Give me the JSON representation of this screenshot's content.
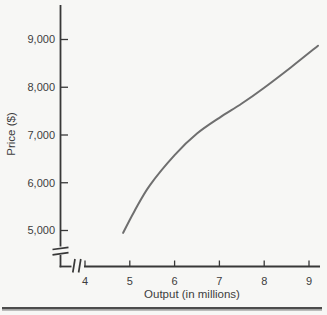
{
  "figure": {
    "background": "#f7f7f5",
    "has_bottom_rule": true
  },
  "colors": {
    "axis": "#383838",
    "tick_text": "#3d3d3d",
    "curve": "#6f6f6f",
    "bottom_rule_dark": "#4c4c4c",
    "bottom_rule_light": "#b5b5b5"
  },
  "chart_data": {
    "type": "line",
    "title": "",
    "xlabel": "Output (in millions)",
    "ylabel": "Price ($)",
    "x_ticks": [
      4,
      5,
      6,
      7,
      8,
      9
    ],
    "x_tick_labels": [
      "4",
      "5",
      "6",
      "7",
      "8",
      "9"
    ],
    "y_ticks": [
      5000,
      6000,
      7000,
      8000,
      9000
    ],
    "y_tick_labels": [
      "5,000",
      "6,000",
      "7,000",
      "8,000",
      "9,000"
    ],
    "xlim": [
      3.6,
      9.35
    ],
    "ylim": [
      4600,
      9600
    ],
    "grid": false,
    "legend": null,
    "axis_breaks": {
      "x_axis": true,
      "y_axis": true
    },
    "series": [
      {
        "name": "price-output-curve",
        "color": "#6f6f6f",
        "points": [
          [
            4.85,
            4950
          ],
          [
            5.1,
            5400
          ],
          [
            5.45,
            5950
          ],
          [
            6.0,
            6580
          ],
          [
            6.5,
            7030
          ],
          [
            7.0,
            7360
          ],
          [
            7.5,
            7660
          ],
          [
            8.0,
            7990
          ],
          [
            8.6,
            8420
          ],
          [
            9.2,
            8870
          ]
        ]
      }
    ]
  }
}
